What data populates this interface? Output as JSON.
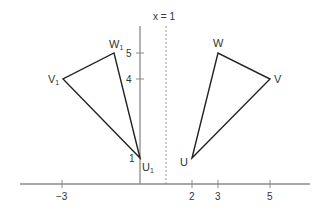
{
  "diagram": {
    "mirror_label": "x = 1",
    "x_ticks": [
      {
        "value": -3,
        "label": "−3"
      },
      {
        "value": 2,
        "label": "2"
      },
      {
        "value": 3,
        "label": "3"
      },
      {
        "value": 5,
        "label": "5"
      }
    ],
    "y_ticks": [
      {
        "value": 5,
        "label": "5"
      },
      {
        "value": 4,
        "label": "4"
      },
      {
        "value": 1,
        "label": "1"
      }
    ],
    "triangle_original": {
      "vertices": [
        {
          "label": "U",
          "x": 2,
          "y": 1
        },
        {
          "label": "V",
          "x": 5,
          "y": 4
        },
        {
          "label": "W",
          "x": 3,
          "y": 5
        }
      ]
    },
    "triangle_image": {
      "vertices": [
        {
          "label": "U",
          "sub": "1",
          "x": 0,
          "y": 1
        },
        {
          "label": "V",
          "sub": "1",
          "x": -3,
          "y": 4
        },
        {
          "label": "W",
          "sub": "1",
          "x": -1,
          "y": 5
        }
      ]
    },
    "colors": {
      "axis": "#888888",
      "triangle": "#222222",
      "mirror": "#999999",
      "text": "#333333"
    }
  }
}
